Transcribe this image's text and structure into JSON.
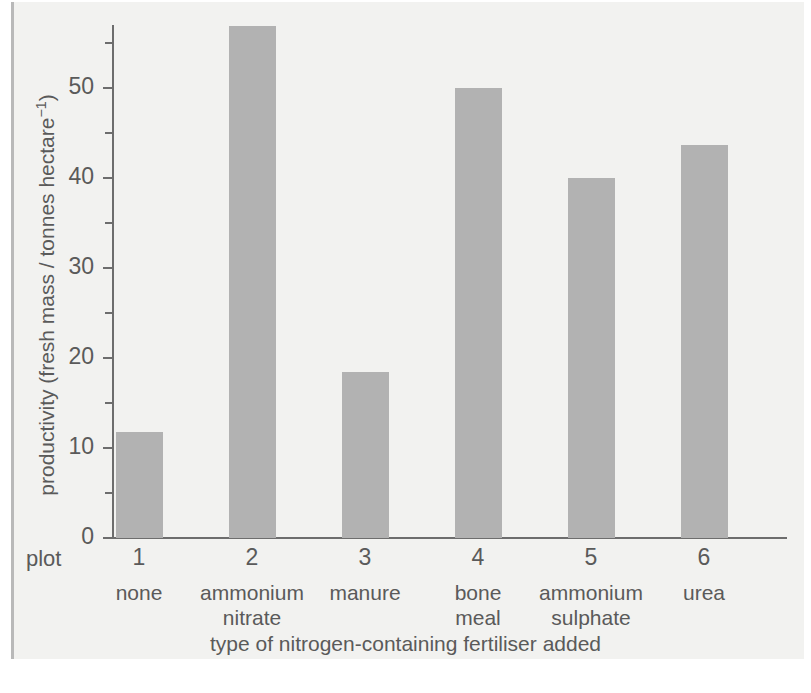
{
  "chart_data": {
    "type": "bar",
    "title": "",
    "xlabel": "type of nitrogen-containing fertiliser added",
    "ylabel": "productivity (fresh mass / tonnes hectare⁻¹)",
    "ylabel_parts": {
      "main": "productivity (fresh mass / tonnes hectare",
      "superscript": "−1",
      "tail": ")"
    },
    "plot_row_label": "plot",
    "categories": [
      "none",
      "ammonium\nnitrate",
      "manure",
      "bone\nmeal",
      "ammonium\nsulphate",
      "urea"
    ],
    "plot_numbers": [
      "1",
      "2",
      "3",
      "4",
      "5",
      "6"
    ],
    "values": [
      11.8,
      56.9,
      18.4,
      50.0,
      40.0,
      43.7
    ],
    "ylim": [
      0,
      58
    ],
    "yticks": [
      0,
      10,
      20,
      30,
      40,
      50
    ],
    "ytick_labels": [
      "0",
      "10",
      "20",
      "30",
      "40",
      "50"
    ],
    "yminor_ticks": [
      5,
      15,
      25,
      35,
      45,
      55
    ],
    "grid": false,
    "legend": "none",
    "bar_color": "#b2b2b2",
    "axis_color": "#6d6d6d",
    "text_color": "#5a5a5a",
    "background_color": "#f2f2f0"
  }
}
